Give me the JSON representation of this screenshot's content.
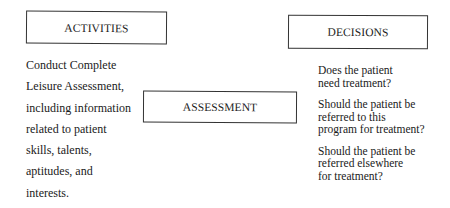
{
  "diagram": {
    "activities": {
      "title": "ACTIVITIES",
      "lines": [
        "Conduct Complete",
        "Leisure Assessment,",
        "including information",
        "related to patient",
        "skills, talents,",
        "aptitudes, and",
        "interests."
      ]
    },
    "assessment": {
      "title": "ASSESSMENT"
    },
    "decisions": {
      "title": "DECISIONS",
      "items": [
        {
          "lines": [
            "Does the patient",
            "need treatment?"
          ]
        },
        {
          "lines": [
            "Should the patient be",
            "referred to this",
            "program for treatment?"
          ]
        },
        {
          "lines": [
            "Should the patient be",
            "referred elsewhere",
            "for treatment?"
          ]
        }
      ]
    }
  }
}
